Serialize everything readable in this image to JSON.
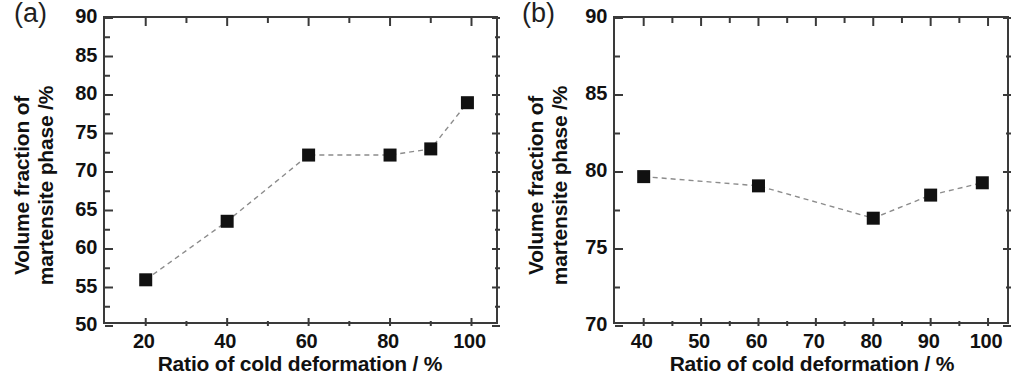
{
  "figure": {
    "panels": [
      {
        "id": "a",
        "label": "(a)",
        "xlabel": "Ratio of cold deformation / %",
        "ylabel_line1": "Volume fraction of",
        "ylabel_line2": "martensite phase /%",
        "xticks": [
          "20",
          "40",
          "60",
          "80",
          "100"
        ],
        "yticks": [
          "50",
          "55",
          "60",
          "65",
          "70",
          "75",
          "80",
          "85",
          "90"
        ]
      },
      {
        "id": "b",
        "label": "(b)",
        "xlabel": "Ratio of cold deformation / %",
        "ylabel_line1": "Volume fraction of",
        "ylabel_line2": "martensite phase /%",
        "xticks": [
          "40",
          "50",
          "60",
          "70",
          "80",
          "90",
          "100"
        ],
        "yticks": [
          "70",
          "75",
          "80",
          "85",
          "90"
        ]
      }
    ]
  },
  "chart_data": [
    {
      "panel": "a",
      "type": "line",
      "title": "(a)",
      "xlabel": "Ratio of cold deformation / %",
      "ylabel": "Volume fraction of martensite phase /%",
      "xlim": [
        10,
        107
      ],
      "ylim": [
        50,
        90
      ],
      "xticks": [
        20,
        40,
        60,
        80,
        100
      ],
      "yticks": [
        50,
        55,
        60,
        65,
        70,
        75,
        80,
        85,
        90
      ],
      "x_minor_ticks": true,
      "y_minor_ticks": true,
      "grid": false,
      "legend": "none",
      "marker": "filled-square",
      "marker_color": "#111111",
      "line_style": "dashed",
      "line_color": "#8c8c8c",
      "x": [
        20,
        40,
        60,
        80,
        90,
        99
      ],
      "values": [
        56.0,
        63.6,
        72.2,
        72.2,
        73.0,
        79.0
      ]
    },
    {
      "panel": "b",
      "type": "line",
      "title": "(b)",
      "xlabel": "Ratio of cold deformation / %",
      "ylabel": "Volume fraction of martensite phase /%",
      "xlim": [
        35,
        104
      ],
      "ylim": [
        70,
        90
      ],
      "xticks": [
        40,
        50,
        60,
        70,
        80,
        90,
        100
      ],
      "yticks": [
        70,
        75,
        80,
        85,
        90
      ],
      "x_minor_ticks": true,
      "y_minor_ticks": true,
      "grid": false,
      "legend": "none",
      "marker": "filled-square",
      "marker_color": "#111111",
      "line_style": "dashed",
      "line_color": "#8c8c8c",
      "x": [
        40,
        60,
        80,
        90,
        99
      ],
      "values": [
        79.7,
        79.1,
        77.0,
        78.5,
        79.3
      ]
    }
  ]
}
